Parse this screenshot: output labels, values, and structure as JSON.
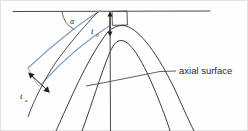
{
  "figure": {
    "background_color": "#fefefe",
    "width": 248,
    "height": 131
  },
  "colors": {
    "bed_blue": "#7b9dc4",
    "bed_blue_light": "#9ab6d6",
    "curve_black": "#3a3a3a",
    "enclosure_line": "#555555",
    "text": "#1c1c1c",
    "frame": "#d6d6d6"
  },
  "labels": {
    "alpha": {
      "text": "α",
      "meaning": "limb-dip-angle",
      "x": 70,
      "y": 21
    },
    "t_zero": {
      "base": "t",
      "sub": "0",
      "meaning": "orthogonal-hinge-thickness",
      "x": 92,
      "y": 32
    },
    "t_alpha": {
      "base": "t",
      "sub": "α",
      "meaning": "orthogonal-limb-thickness",
      "x": 21,
      "y": 97
    },
    "axial_surface": {
      "text": "axial surface",
      "meaning": "axial-surface-annotation",
      "x": 180,
      "y": 71
    }
  },
  "elements": {
    "enveloping_surface": "horizontal-tangent-line",
    "right_angle_marker": "right-angle-square-at-hinge",
    "axial_trace": "vertical-axial-surface-trace",
    "leader_line": "axial-surface-leader",
    "t_zero_arrow": "double-headed-vertical-arrow",
    "t_alpha_arrow": "double-headed-perpendicular-arrow",
    "angle_arc": "alpha-angle-arc",
    "bed_blue_outer": "blue-limb-line-outer",
    "bed_blue_inner": "blue-limb-line-inner",
    "fold_curve_outer": "outer-fold-curve",
    "fold_curve_inner": "inner-fold-curve",
    "fold_curve_right_outer": "outer-right-fold-curve",
    "fold_curve_right_inner": "inner-right-fold-curve"
  }
}
